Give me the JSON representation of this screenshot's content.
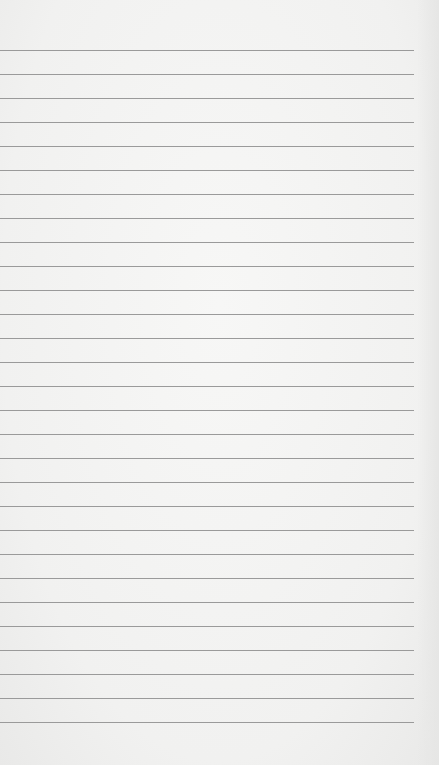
{
  "paper": {
    "background": "#f3f3f2",
    "line_color": "#9a9a9a",
    "first_line_y": 50,
    "line_spacing": 24,
    "line_count": 29,
    "line_width": 414
  }
}
